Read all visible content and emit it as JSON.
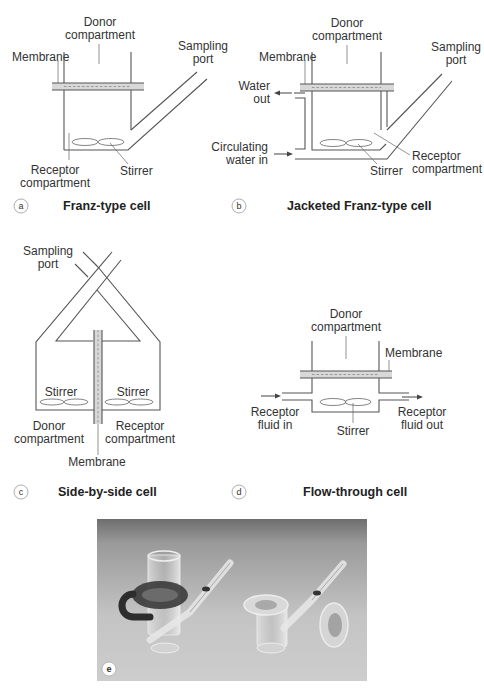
{
  "panels": {
    "a": {
      "badge": "a",
      "caption": "Franz-type cell",
      "labels": {
        "donor_line1": "Donor",
        "donor_line2": "compartment",
        "membrane": "Membrane",
        "sampling_line1": "Sampling",
        "sampling_line2": "port",
        "receptor_line1": "Receptor",
        "receptor_line2": "compartment",
        "stirrer": "Stirrer"
      }
    },
    "b": {
      "badge": "b",
      "caption": "Jacketed Franz-type cell",
      "labels": {
        "donor_line1": "Donor",
        "donor_line2": "compartment",
        "membrane": "Membrane",
        "sampling_line1": "Sampling",
        "sampling_line2": "port",
        "water_out_line1": "Water",
        "water_out_line2": "out",
        "water_in_line1": "Circulating",
        "water_in_line2": "water in",
        "receptor_line1": "Receptor",
        "receptor_line2": "compartment",
        "stirrer": "Stirrer"
      }
    },
    "c": {
      "badge": "c",
      "caption": "Side-by-side cell",
      "labels": {
        "sampling_line1": "Sampling",
        "sampling_line2": "port",
        "stirrer_left": "Stirrer",
        "stirrer_right": "Stirrer",
        "donor_line1": "Donor",
        "donor_line2": "compartment",
        "receptor_line1": "Receptor",
        "receptor_line2": "compartment",
        "membrane": "Membrane"
      }
    },
    "d": {
      "badge": "d",
      "caption": "Flow-through cell",
      "labels": {
        "donor_line1": "Donor",
        "donor_line2": "compartment",
        "membrane": "Membrane",
        "fluid_in_line1": "Receptor",
        "fluid_in_line2": "fluid in",
        "fluid_out_line1": "Receptor",
        "fluid_out_line2": "fluid out",
        "stirrer": "Stirrer"
      }
    },
    "e": {
      "badge": "e",
      "photo_description": "Photograph of two glass Franz diffusion cells on grey background"
    }
  },
  "colors": {
    "line": "#555555",
    "membrane_fill": "#d8d8d8",
    "photo_bg_top": "#8a8a8a",
    "photo_bg_bottom": "#cfcfcf"
  }
}
